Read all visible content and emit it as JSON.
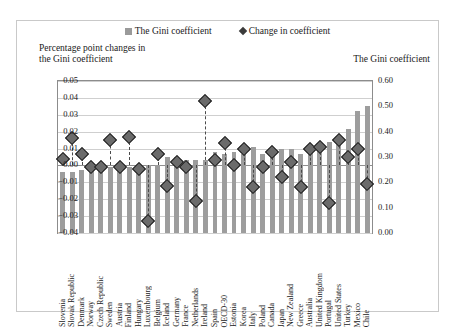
{
  "legend": {
    "bar_label": "The Gini coefficient",
    "diamond_label": "Change in coefficient"
  },
  "captions": {
    "left_line1": "Percentage point changes in",
    "left_line2": "the Gini coefficient",
    "right": "The Gini coefficient"
  },
  "colors": {
    "bar": "#9d9d9d",
    "diamond_fill": "#6b6b6b",
    "diamond_edge": "#1e1e1e",
    "grid": "#cfcfcf",
    "axis": "#8c8c8c",
    "text": "#1a1a1a"
  },
  "chart_data": {
    "type": "bar",
    "title": "",
    "xlabel": "",
    "ylabel": "Percentage point changes in the Gini coefficient",
    "y2label": "The Gini coefficient",
    "ylim": [
      -0.04,
      0.05
    ],
    "y2lim": [
      0.0,
      0.6
    ],
    "yticks": [
      "0.05",
      "0.04",
      "0.03",
      "0.02",
      "0.01",
      "0.00",
      "-0.01",
      "-0.02",
      "-0.03",
      "-0.04"
    ],
    "y2ticks": [
      "0.60",
      "0.50",
      "0.40",
      "0.30",
      "0.20",
      "0.10",
      "0.00"
    ],
    "grid": true,
    "legend_position": "top-center",
    "categories": [
      "Slovenia",
      "Slovak Republic",
      "Denmark",
      "Norway",
      "Czech Republic",
      "Sweden",
      "Austria",
      "Finland",
      "Hungary",
      "Luxembourg",
      "Belgium",
      "Iceland",
      "Germany",
      "France",
      "Netherlands",
      "Ireland",
      "Spain",
      "OECD-30",
      "Estonia",
      "Korea",
      "Italy",
      "Poland",
      "Canada",
      "Japan",
      "New Zealand",
      "Greece",
      "Australia",
      "United Kingdom",
      "Portugal",
      "United States",
      "Turkey",
      "Mexico",
      "Chile"
    ],
    "series": [
      {
        "name": "The Gini coefficient",
        "axis": "right",
        "type": "bar",
        "values": [
          0.24,
          0.24,
          0.25,
          0.25,
          0.26,
          0.26,
          0.26,
          0.26,
          0.27,
          0.27,
          0.27,
          0.3,
          0.3,
          0.29,
          0.29,
          0.29,
          0.32,
          0.31,
          0.32,
          0.31,
          0.34,
          0.31,
          0.32,
          0.33,
          0.33,
          0.31,
          0.34,
          0.34,
          0.36,
          0.38,
          0.41,
          0.48,
          0.5
        ]
      },
      {
        "name": "Change in coefficient",
        "axis": "left",
        "type": "scatter",
        "values": [
          0.004,
          0.016,
          0.007,
          -0.001,
          -0.001,
          0.015,
          -0.001,
          0.017,
          -0.002,
          -0.033,
          0.007,
          -0.012,
          0.002,
          -0.001,
          -0.021,
          0.038,
          0.003,
          0.013,
          0.0,
          0.01,
          -0.013,
          -0.001,
          0.008,
          -0.007,
          0.002,
          -0.013,
          0.01,
          0.011,
          -0.022,
          0.015,
          0.005,
          0.01,
          -0.011
        ]
      }
    ]
  }
}
